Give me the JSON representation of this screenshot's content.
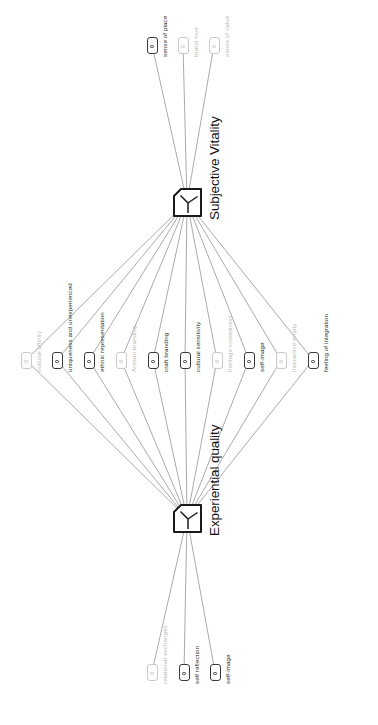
{
  "diagram": {
    "type": "concept-network",
    "orientation": "rotated-90-ccw",
    "title": "",
    "hubs": [
      {
        "id": "subjective-vitality",
        "label": "Subjective Vitality",
        "x": 187,
        "y": 202
      },
      {
        "id": "experiential-quality",
        "label": "Experiential quality",
        "x": 187,
        "y": 518
      }
    ],
    "leaves": [
      {
        "id": "sense-of-place",
        "label": "sense of place",
        "x": 152,
        "y": 45,
        "faded": false,
        "group": "top"
      },
      {
        "id": "brand-love",
        "label": "brand love",
        "x": 183,
        "y": 45,
        "faded": true,
        "group": "top"
      },
      {
        "id": "sense-of-value",
        "label": "sense of value",
        "x": 214,
        "y": 45,
        "faded": true,
        "group": "top"
      },
      {
        "id": "cultural-affinity",
        "label": "cultural affinity",
        "x": 26,
        "y": 360,
        "faded": true,
        "group": "middle"
      },
      {
        "id": "uniqueness-and-unexperienced",
        "label": "uniqueness and unexperienced",
        "x": 57,
        "y": 360,
        "faded": false,
        "group": "middle"
      },
      {
        "id": "ethnic-representation",
        "label": "ethnic representation",
        "x": 89,
        "y": 360,
        "faded": false,
        "group": "middle"
      },
      {
        "id": "artisan-branding",
        "label": "Artisan branding",
        "x": 121,
        "y": 360,
        "faded": true,
        "group": "middle"
      },
      {
        "id": "craft-branding",
        "label": "craft branding",
        "x": 153,
        "y": 360,
        "faded": false,
        "group": "middle"
      },
      {
        "id": "cultural-sensitivity",
        "label": "cultural sensitivity",
        "x": 185,
        "y": 360,
        "faded": false,
        "group": "middle"
      },
      {
        "id": "heritage-rootedness",
        "label": "heritage rootedness",
        "x": 217,
        "y": 360,
        "faded": true,
        "group": "middle"
      },
      {
        "id": "self-image-mid",
        "label": "self-image",
        "x": 249,
        "y": 360,
        "faded": false,
        "group": "middle"
      },
      {
        "id": "interactive-empty",
        "label": "interactive empty",
        "x": 281,
        "y": 360,
        "faded": true,
        "group": "middle"
      },
      {
        "id": "feeling-of-integration",
        "label": "feeling of integration",
        "x": 313,
        "y": 360,
        "faded": false,
        "group": "middle"
      },
      {
        "id": "relational-exchanges",
        "label": "relational exchanges",
        "x": 152,
        "y": 672,
        "faded": true,
        "group": "bottom"
      },
      {
        "id": "self-reflection",
        "label": "self reflection",
        "x": 184,
        "y": 672,
        "faded": false,
        "group": "bottom"
      },
      {
        "id": "self-image-bottom",
        "label": "self-image",
        "x": 215,
        "y": 672,
        "faded": false,
        "group": "bottom"
      }
    ],
    "edges": [
      {
        "from": "subjective-vitality",
        "to": "sense-of-place"
      },
      {
        "from": "subjective-vitality",
        "to": "brand-love"
      },
      {
        "from": "subjective-vitality",
        "to": "sense-of-value"
      },
      {
        "from": "subjective-vitality",
        "to": "cultural-affinity"
      },
      {
        "from": "subjective-vitality",
        "to": "uniqueness-and-unexperienced"
      },
      {
        "from": "subjective-vitality",
        "to": "ethnic-representation"
      },
      {
        "from": "subjective-vitality",
        "to": "artisan-branding"
      },
      {
        "from": "subjective-vitality",
        "to": "craft-branding"
      },
      {
        "from": "subjective-vitality",
        "to": "cultural-sensitivity"
      },
      {
        "from": "subjective-vitality",
        "to": "heritage-rootedness"
      },
      {
        "from": "subjective-vitality",
        "to": "self-image-mid"
      },
      {
        "from": "subjective-vitality",
        "to": "interactive-empty"
      },
      {
        "from": "subjective-vitality",
        "to": "feeling-of-integration"
      },
      {
        "from": "experiential-quality",
        "to": "cultural-affinity"
      },
      {
        "from": "experiential-quality",
        "to": "uniqueness-and-unexperienced"
      },
      {
        "from": "experiential-quality",
        "to": "ethnic-representation"
      },
      {
        "from": "experiential-quality",
        "to": "artisan-branding"
      },
      {
        "from": "experiential-quality",
        "to": "craft-branding"
      },
      {
        "from": "experiential-quality",
        "to": "cultural-sensitivity"
      },
      {
        "from": "experiential-quality",
        "to": "heritage-rootedness"
      },
      {
        "from": "experiential-quality",
        "to": "self-image-mid"
      },
      {
        "from": "experiential-quality",
        "to": "interactive-empty"
      },
      {
        "from": "experiential-quality",
        "to": "feeling-of-integration"
      },
      {
        "from": "experiential-quality",
        "to": "relational-exchanges"
      },
      {
        "from": "experiential-quality",
        "to": "self-reflection"
      },
      {
        "from": "experiential-quality",
        "to": "self-image-bottom"
      }
    ],
    "colors": {
      "edge": "#8d8d8d",
      "node_stroke": "#3a3a3a",
      "node_stroke_faded": "#c9c9c9",
      "hub_stroke": "#1a1a1a",
      "text": "#1f1f1f",
      "text_faded": "#b8b8b8",
      "background": "#ffffff"
    }
  }
}
